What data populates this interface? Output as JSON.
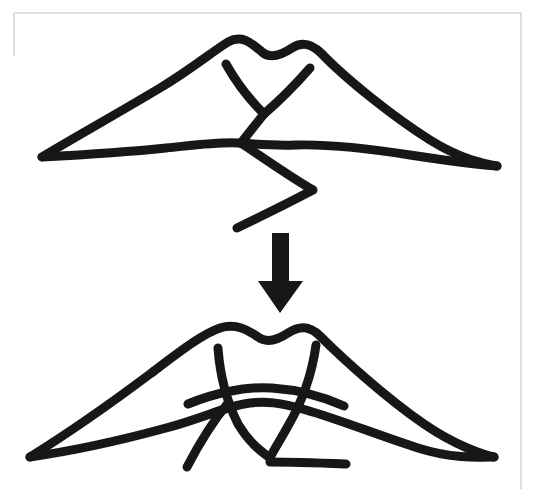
{
  "page": {
    "width": 539,
    "height": 493,
    "background_color": "#ffffff",
    "ink_color": "#171717",
    "frame_color": "#d6d6d6"
  },
  "frame": {
    "name": "scanned-page-border",
    "visible": true,
    "left": 14,
    "top": 13,
    "right": 521,
    "bottom": 489,
    "color": "#d6d6d6",
    "thickness": 1.6
  },
  "figures": {
    "top": {
      "label": "source-sketch",
      "caption": "",
      "stroke_width": 9,
      "bounds": {
        "x": 40,
        "y": 36,
        "width": 460,
        "height": 196
      },
      "paths": {
        "outer_canopy": "M 42 157 C 70 140 120 112 160 88 C 190 70 212 52 228 42 C 243 34 252 44 262 52 C 270 59 280 56 292 48 C 303 41 312 44 322 54 C 345 78 392 116 430 140 C 462 160 486 164 497 166",
        "lower_ridge": "M 42 157 C 80 155 128 152 166 148 C 196 145 218 142 238 143 C 256 144 272 146 296 145 C 330 144 372 149 410 155 C 450 161 482 165 497 166",
        "v_left_arm": "M 226 64 C 236 82 250 100 264 114",
        "v_right_arm": "M 310 68 C 296 84 278 102 264 114",
        "v_stem": "M 264 114 C 256 124 248 134 241 143",
        "zigzag": "M 241 143 C 262 157 292 178 313 190 C 292 201 260 217 237 228"
      }
    },
    "bottom": {
      "label": "result-sketch",
      "caption": "",
      "stroke_width": 9,
      "bounds": {
        "x": 28,
        "y": 320,
        "width": 470,
        "height": 160
      },
      "paths": {
        "outer_canopy": "M 30 457 C 62 437 110 404 150 374 C 178 353 202 334 220 328 C 236 323 248 330 258 337 C 266 343 276 341 288 333 C 300 325 310 326 320 336 C 342 358 386 398 424 424 C 456 446 484 455 494 457",
        "lower_ridge": "M 30 457 C 72 451 122 440 166 428 C 200 419 222 408 244 404 C 264 400 282 403 306 410 C 338 419 380 436 418 448 C 456 460 484 457 494 457",
        "belly_arc": "M 188 404 C 212 394 244 386 272 388 C 302 390 326 398 344 406",
        "left_rib": "M 218 348 C 220 376 226 400 238 424 C 250 444 262 452 270 458",
        "right_rib": "M 316 345 C 312 374 302 402 288 426 C 278 444 272 453 270 458",
        "left_diagonal": "M 228 403 C 214 420 200 442 187 467",
        "bottom_tail": "M 270 462 C 292 462 320 463 346 464"
      }
    }
  },
  "arrow": {
    "name": "transformation-arrow",
    "direction": "down",
    "color": "#171717",
    "shaft": {
      "x": 272,
      "y": 233,
      "width": 17,
      "height": 50
    },
    "head": {
      "left": 258,
      "right": 303,
      "top": 281,
      "tip_x": 280,
      "tip_y": 313
    },
    "polygon": "272,233 289,233 289,281 303,281 280,313 258,281 272,281"
  },
  "labels": {
    "top_figure_label": "",
    "bottom_figure_label": "",
    "arrow_label": ""
  }
}
